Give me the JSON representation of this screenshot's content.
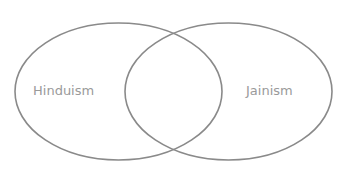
{
  "diagram": {
    "type": "venn",
    "sets": [
      {
        "label": "Hinduism",
        "cx": 118.5,
        "cy": 91.5,
        "rx": 103.5,
        "ry": 68.5
      },
      {
        "label": "Jainism",
        "cx": 228.5,
        "cy": 91.5,
        "rx": 103.5,
        "ry": 68.5
      }
    ],
    "intersection_label": "",
    "colors": {
      "stroke": "#8a8a8a",
      "label": "#9a9a9a",
      "background": "#ffffff"
    }
  }
}
